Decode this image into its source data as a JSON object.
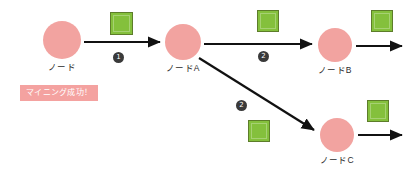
{
  "diagram": {
    "background": "#ffffff",
    "palette": {
      "node_fill": "#f2a3a0",
      "block_fill": "#84c03c",
      "block_border": "#5d7d2a",
      "arrow": "#111111",
      "badge_fill": "#3a3a3a",
      "tag_fill": "#f4a2a0",
      "label_text": "#2b2b2b"
    },
    "nodes": [
      {
        "id": "node",
        "label": "ノード",
        "cx": 62,
        "cy": 40,
        "r": 19,
        "label_x": 62,
        "label_y": 60
      },
      {
        "id": "nodeA",
        "label": "ノードA",
        "cx": 183,
        "cy": 42,
        "r": 18,
        "label_x": 183,
        "label_y": 61
      },
      {
        "id": "nodeB",
        "label": "ノードB",
        "cx": 335,
        "cy": 45,
        "r": 17,
        "label_x": 335,
        "label_y": 63
      },
      {
        "id": "nodeC",
        "label": "ノードC",
        "cx": 337,
        "cy": 135,
        "r": 17,
        "label_x": 337,
        "label_y": 153
      }
    ],
    "blocks": [
      {
        "id": "block-1",
        "x": 110,
        "y": 12,
        "size": 23
      },
      {
        "id": "block-2",
        "x": 257,
        "y": 10,
        "size": 22
      },
      {
        "id": "block-3",
        "x": 371,
        "y": 10,
        "size": 22
      },
      {
        "id": "block-4",
        "x": 248,
        "y": 120,
        "size": 22
      },
      {
        "id": "block-5",
        "x": 367,
        "y": 100,
        "size": 22
      }
    ],
    "arrows": [
      {
        "id": "arrow-node-to-nodeA",
        "x1": 84,
        "y1": 42,
        "x2": 160,
        "y2": 42
      },
      {
        "id": "arrow-nodeA-to-nodeB",
        "x1": 204,
        "y1": 44,
        "x2": 312,
        "y2": 44
      },
      {
        "id": "arrow-nodeA-to-nodeC",
        "x1": 199,
        "y1": 58,
        "x2": 314,
        "y2": 130
      },
      {
        "id": "arrow-nodeB-out",
        "x1": 356,
        "y1": 46,
        "x2": 402,
        "y2": 46
      },
      {
        "id": "arrow-nodeC-out",
        "x1": 358,
        "y1": 135,
        "x2": 402,
        "y2": 135
      }
    ],
    "badges": [
      {
        "id": "badge-1",
        "text": "1",
        "x": 113,
        "y": 52
      },
      {
        "id": "badge-2-top",
        "text": "2",
        "x": 258,
        "y": 51
      },
      {
        "id": "badge-2-bottom",
        "text": "2",
        "x": 236,
        "y": 100
      }
    ],
    "tag": {
      "text": "マイニング成功！",
      "x": 20,
      "y": 85
    }
  }
}
